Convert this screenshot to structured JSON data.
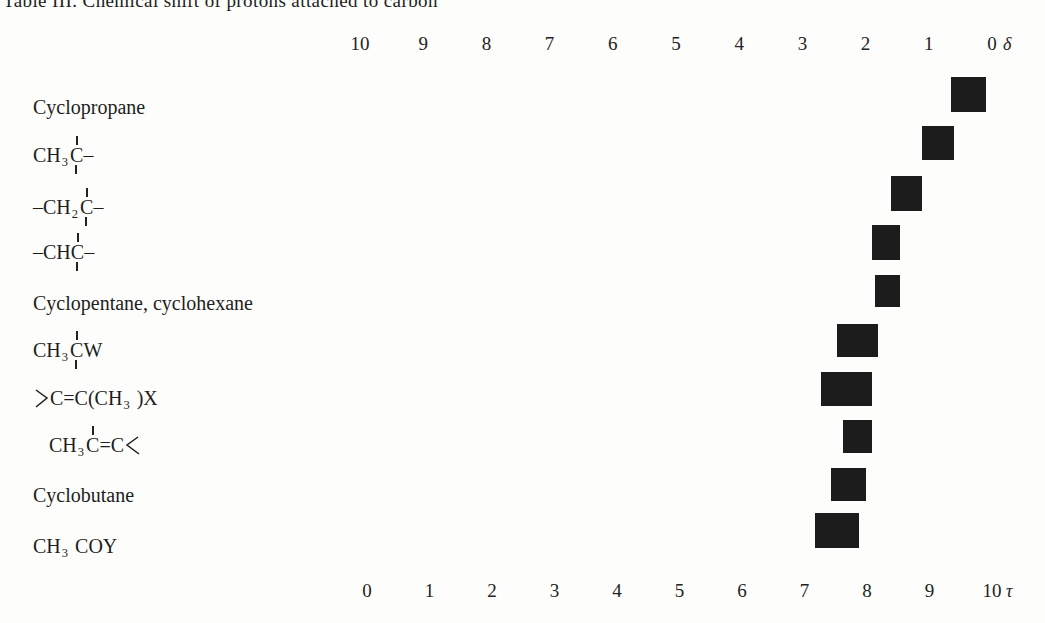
{
  "page": {
    "title": "Table III. Chemical shift of protons attached to carbon"
  },
  "chart_data": {
    "type": "bar",
    "title": "Table III. Chemical shift of protons attached to carbon",
    "band_color": "#1c1c1c",
    "top_axis": {
      "label": "δ",
      "ticks": [
        10,
        9,
        8,
        7,
        6,
        5,
        4,
        3,
        2,
        1,
        0
      ],
      "range": [
        10,
        0
      ]
    },
    "bottom_axis": {
      "label": "τ",
      "ticks": [
        0,
        1,
        2,
        3,
        4,
        5,
        6,
        7,
        8,
        9,
        10
      ],
      "range": [
        0,
        10
      ]
    },
    "rows": [
      {
        "name": "Cyclopropane",
        "delta_range": [
          0.1,
          0.65
        ],
        "tau_range": [
          9.35,
          9.9
        ],
        "label": [
          {
            "t": "Cyclopropane"
          }
        ]
      },
      {
        "name": "CH3C-",
        "delta_range": [
          0.6,
          1.1
        ],
        "tau_range": [
          8.9,
          9.4
        ],
        "label": [
          {
            "t": "CH"
          },
          {
            "t": "3",
            "k": "sub"
          },
          {
            "t": "C",
            "k": "bond-both"
          },
          {
            "t": "–"
          }
        ]
      },
      {
        "name": "-CH2C-",
        "delta_range": [
          1.1,
          1.6
        ],
        "tau_range": [
          8.4,
          8.9
        ],
        "label": [
          {
            "t": "–CH"
          },
          {
            "t": "2",
            "k": "sub"
          },
          {
            "t": "C",
            "k": "bond-both"
          },
          {
            "t": "–"
          }
        ]
      },
      {
        "name": "-CHC-",
        "delta_range": [
          1.45,
          1.9
        ],
        "tau_range": [
          8.1,
          8.55
        ],
        "label": [
          {
            "t": "–CH"
          },
          {
            "t": "C",
            "k": "bond-both"
          },
          {
            "t": "–"
          }
        ]
      },
      {
        "name": "Cyclopentane, cyclohexane",
        "delta_range": [
          1.45,
          1.85
        ],
        "tau_range": [
          8.15,
          8.55
        ],
        "label": [
          {
            "t": "Cyclopentane, cyclohexane"
          }
        ]
      },
      {
        "name": "CH3CW",
        "delta_range": [
          1.8,
          2.45
        ],
        "tau_range": [
          7.55,
          8.2
        ],
        "label": [
          {
            "t": "CH"
          },
          {
            "t": "3",
            "k": "sub"
          },
          {
            "t": "C",
            "k": "bond-both"
          },
          {
            "t": "W"
          }
        ]
      },
      {
        "name": ">C=C(CH3)X",
        "delta_range": [
          1.9,
          2.7
        ],
        "tau_range": [
          7.3,
          8.1
        ],
        "label": [
          {
            "k": "gt"
          },
          {
            "t": "C=C(CH"
          },
          {
            "t": "3",
            "k": "sub"
          },
          {
            "t": " )X"
          }
        ]
      },
      {
        "name": "CH3C=C<",
        "delta_range": [
          1.9,
          2.35
        ],
        "tau_range": [
          7.65,
          8.1
        ],
        "indent": true,
        "label": [
          {
            "t": "CH"
          },
          {
            "t": "3",
            "k": "sub"
          },
          {
            "t": "C",
            "k": "bond-above"
          },
          {
            "t": "=C"
          },
          {
            "k": "lt"
          }
        ]
      },
      {
        "name": "Cyclobutane",
        "delta_range": [
          2.0,
          2.55
        ],
        "tau_range": [
          7.45,
          8.0
        ],
        "label": [
          {
            "t": "Cyclobutane"
          }
        ]
      },
      {
        "name": "CH3COY",
        "delta_range": [
          2.1,
          2.8
        ],
        "tau_range": [
          7.2,
          7.9
        ],
        "label": [
          {
            "t": "CH"
          },
          {
            "t": "3",
            "k": "sub"
          },
          {
            "t": " COY"
          }
        ]
      }
    ]
  }
}
